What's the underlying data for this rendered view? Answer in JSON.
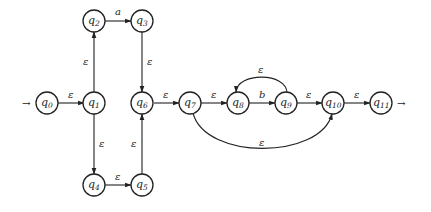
{
  "diagram": {
    "type": "nfa",
    "title": "",
    "start_state": "q0",
    "accept_state": "q11",
    "states": [
      {
        "id": "q0",
        "base": "q",
        "sub": "0",
        "x": 47,
        "y": 103
      },
      {
        "id": "q1",
        "base": "q",
        "sub": "1",
        "x": 95,
        "y": 103
      },
      {
        "id": "q2",
        "base": "q",
        "sub": "2",
        "x": 94,
        "y": 21
      },
      {
        "id": "q3",
        "base": "q",
        "sub": "3",
        "x": 142,
        "y": 21
      },
      {
        "id": "q4",
        "base": "q",
        "sub": "4",
        "x": 94,
        "y": 185
      },
      {
        "id": "q5",
        "base": "q",
        "sub": "5",
        "x": 142,
        "y": 185
      },
      {
        "id": "q6",
        "base": "q",
        "sub": "6",
        "x": 143,
        "y": 103
      },
      {
        "id": "q7",
        "base": "q",
        "sub": "7",
        "x": 190,
        "y": 103
      },
      {
        "id": "q8",
        "base": "q",
        "sub": "8",
        "x": 238,
        "y": 103
      },
      {
        "id": "q9",
        "base": "q",
        "sub": "9",
        "x": 286,
        "y": 103
      },
      {
        "id": "q10",
        "base": "q",
        "sub": "10",
        "x": 333,
        "y": 103
      },
      {
        "id": "q11",
        "base": "q",
        "sub": "11",
        "x": 381,
        "y": 103
      }
    ],
    "transitions": [
      {
        "from": "q0",
        "to": "q1",
        "label": "ε"
      },
      {
        "from": "q1",
        "to": "q2",
        "label": "ε"
      },
      {
        "from": "q2",
        "to": "q3",
        "label": "a"
      },
      {
        "from": "q3",
        "to": "q6",
        "label": "ε"
      },
      {
        "from": "q1",
        "to": "q4",
        "label": "ε"
      },
      {
        "from": "q4",
        "to": "q5",
        "label": "ε"
      },
      {
        "from": "q5",
        "to": "q6",
        "label": "ε"
      },
      {
        "from": "q6",
        "to": "q7",
        "label": "ε"
      },
      {
        "from": "q7",
        "to": "q8",
        "label": "ε"
      },
      {
        "from": "q8",
        "to": "q9",
        "label": "b"
      },
      {
        "from": "q9",
        "to": "q8",
        "label": "ε"
      },
      {
        "from": "q9",
        "to": "q10",
        "label": "ε"
      },
      {
        "from": "q7",
        "to": "q10",
        "label": "ε"
      },
      {
        "from": "q10",
        "to": "q11",
        "label": "ε"
      }
    ],
    "start_arrow": "→",
    "accept_arrow": "→"
  }
}
